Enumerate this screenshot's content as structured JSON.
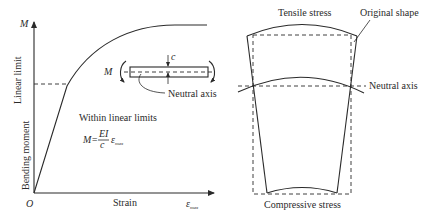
{
  "left_panel": {
    "y_axis_symbol": "M",
    "y_axis_label": "Bending moment",
    "linear_limit_label": "Linear limit",
    "x_axis_label": "Strain",
    "x_axis_symbol": "ε",
    "x_axis_symbol_sub": "max",
    "origin_label": "O",
    "region_label": "Within linear limits",
    "formula": {
      "lhs": "M=",
      "numerator": "EI",
      "denominator": "c",
      "strain": "ε",
      "strain_sub": "max"
    },
    "inset": {
      "moment_label": "M",
      "depth_label": "c",
      "neutral_axis_label": "Neutral axis"
    }
  },
  "right_panel": {
    "top_label": "Tensile stress",
    "original_shape_label": "Original shape",
    "neutral_axis_label": "Neutral axis",
    "bottom_label": "Compressive stress"
  },
  "colors": {
    "line": "#2a2a2a",
    "background": "#ffffff"
  }
}
